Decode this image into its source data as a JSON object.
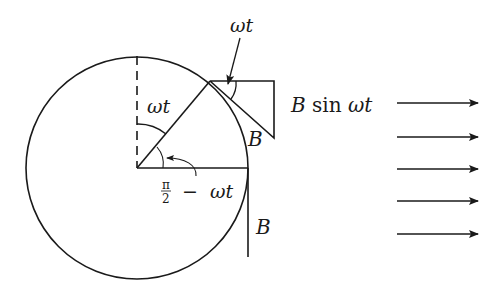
{
  "diagram": {
    "labels": {
      "omega_t_top": "ωt",
      "omega_t_inner": "ωt",
      "angle_complement_num": "π",
      "angle_complement_den": "2",
      "angle_complement_rest": "−  ωt",
      "b_tangent": "B",
      "b_vertical": "B",
      "b_sin_b": "B",
      "b_sin_rest": " sin ",
      "b_sin_wt": "ωt"
    },
    "circle": {
      "cx": 137,
      "cy": 168,
      "r": 110
    },
    "field_arrows": {
      "count": 5,
      "y": [
        103,
        136,
        169,
        202,
        235
      ],
      "x_start": 397,
      "x_end": 478
    },
    "colors": {
      "ink": "#1a1a1a",
      "background": "#ffffff"
    }
  }
}
